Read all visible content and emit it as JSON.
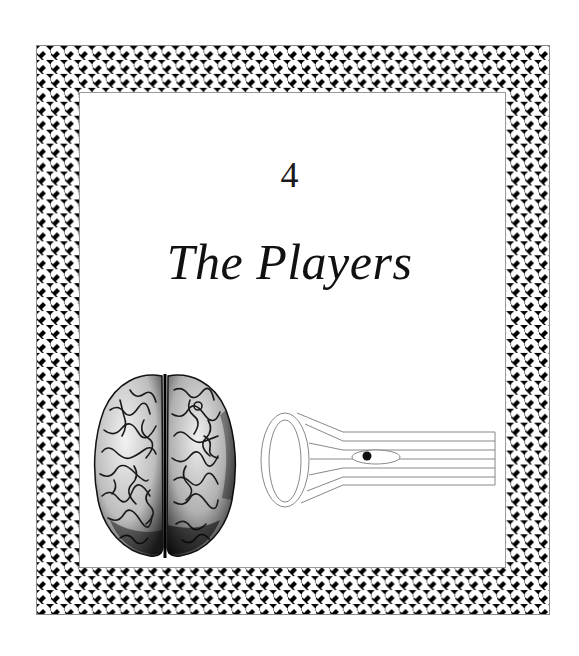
{
  "page": {
    "chapter_number": "4",
    "chapter_title": "The Players"
  },
  "frame": {
    "style": "basket-weave-border",
    "pattern_colors": {
      "strand": "#ffffff",
      "background": "#000000",
      "outline": "#8a8a8a"
    }
  },
  "illustrations": {
    "brain": {
      "label": "brain-top-view-engraving",
      "icon": "brain-icon"
    },
    "fiber": {
      "label": "cell-fiber-diagram",
      "icon": "fiber-cell-icon",
      "horizontal_lines": 7,
      "nucleus_dot_color": "#111111"
    }
  }
}
